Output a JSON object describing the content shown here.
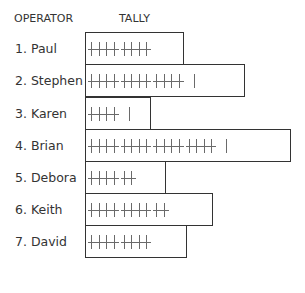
{
  "headers": {
    "operator": "OPERATOR",
    "tally": "TALLY"
  },
  "colors": {
    "border": "#333333",
    "mark": "#6a6a6a",
    "text": "#333333"
  },
  "rows": [
    {
      "label": "1. Paul",
      "count": 10,
      "groups": [
        4,
        4
      ],
      "singles": 0,
      "box": {
        "top": 32,
        "width": 99
      }
    },
    {
      "label": "2. Stephen",
      "count": 16,
      "groups": [
        4,
        4,
        4
      ],
      "singles": 1,
      "box": {
        "top": 64,
        "width": 160
      }
    },
    {
      "label": "3. Karen",
      "count": 6,
      "groups": [
        4
      ],
      "singles": 1,
      "box": {
        "top": 97,
        "width": 66
      }
    },
    {
      "label": "4. Brian",
      "count": 21,
      "groups": [
        4,
        4,
        4,
        4
      ],
      "singles": 1,
      "box": {
        "top": 129,
        "width": 206
      }
    },
    {
      "label": "5. Debora",
      "count": 7,
      "groups": [
        4,
        2
      ],
      "singles": 0,
      "box": {
        "top": 161,
        "width": 81
      }
    },
    {
      "label": "6. Keith",
      "count": 12,
      "groups": [
        4,
        4,
        2
      ],
      "singles": 0,
      "box": {
        "top": 193,
        "width": 128
      }
    },
    {
      "label": "7. David",
      "count": 10,
      "groups": [
        4,
        4
      ],
      "singles": 0,
      "box": {
        "top": 225,
        "width": 102
      }
    }
  ]
}
